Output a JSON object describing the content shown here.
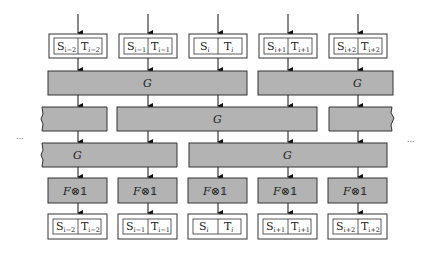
{
  "diagram": {
    "colors": {
      "block_fill": "#b3b3b3",
      "stroke": "#333333",
      "background": "#ffffff"
    },
    "ellipsis_left": "···",
    "ellipsis_right": "···",
    "columns": [
      {
        "s_label": "S",
        "s_index": "i−2",
        "t_label": "T",
        "t_index": "i−2"
      },
      {
        "s_label": "S",
        "s_index": "i−1",
        "t_label": "T",
        "t_index": "i−1"
      },
      {
        "s_label": "S",
        "s_index": "i",
        "t_label": "T",
        "t_index": "i"
      },
      {
        "s_label": "S",
        "s_index": "i+1",
        "t_label": "T",
        "t_index": "i+1"
      },
      {
        "s_label": "S",
        "s_index": "i+2",
        "t_label": "T",
        "t_index": "i+2"
      }
    ],
    "gate_rows": [
      {
        "blocks": [
          {
            "label": "G",
            "span": "cols 1-3"
          },
          {
            "label": "G",
            "span": "cols 4-5"
          }
        ]
      },
      {
        "blocks": [
          {
            "label": "",
            "span": "col 1 (continued left)"
          },
          {
            "label": "G",
            "span": "cols 2-4"
          },
          {
            "label": "",
            "span": "col 5 (continued right)"
          }
        ]
      },
      {
        "blocks": [
          {
            "label": "G",
            "span": "cols 1-2 (continued left)"
          },
          {
            "label": "G",
            "span": "cols 3-5"
          }
        ]
      }
    ],
    "local_gate_label_F": "F",
    "local_gate_label_op": "⊗",
    "local_gate_label_id": "𝟙"
  }
}
